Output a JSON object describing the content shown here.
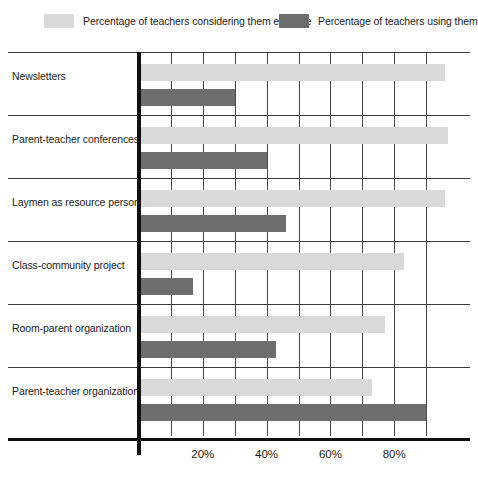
{
  "chart_data": {
    "type": "bar",
    "orientation": "horizontal",
    "title": "",
    "subtitle": "",
    "xlabel": "",
    "ylabel": "",
    "xlim": [
      0,
      100
    ],
    "xticks": [
      20,
      40,
      60,
      80
    ],
    "xtick_labels": [
      "20%",
      "40%",
      "60%",
      "80%"
    ],
    "grid": true,
    "grid_axis": "x",
    "legend_position": "top",
    "categories": [
      "Newsletters",
      "Parent-teacher conferences",
      "Laymen as resource persons",
      "Class-community project",
      "Room-parent organization",
      "Parent-teacher organization"
    ],
    "series": [
      {
        "name": "Percentage of teachers considering them effective",
        "color": "#d9d9d9",
        "values": [
          96,
          97,
          96,
          83,
          77,
          73
        ]
      },
      {
        "name": "Percentage of teachers using them",
        "color": "#6e6e6e",
        "values": [
          30,
          40,
          46,
          17,
          43,
          90
        ]
      }
    ]
  },
  "legend": {
    "entries": [
      {
        "label": "Percentage of teachers considering them effective",
        "color": "#d9d9d9"
      },
      {
        "label": "Percentage of teachers using them",
        "color": "#6e6e6e"
      }
    ]
  },
  "axis": {
    "tick_labels": [
      "20%",
      "40%",
      "60%",
      "80%"
    ],
    "tick_values": [
      20,
      40,
      60,
      80
    ]
  },
  "colors": {
    "effective": "#d9d9d9",
    "using": "#6e6e6e",
    "axis": "#101010",
    "grid": "#4a4a4a",
    "text": "#1c1c1c",
    "background": "#ffffff"
  }
}
